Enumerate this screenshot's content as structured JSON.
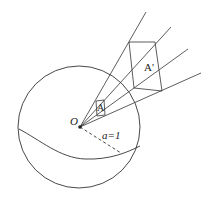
{
  "diagram": {
    "type": "geometry",
    "labels": {
      "origin": "O",
      "small_patch": "A",
      "projected_patch": "A'",
      "radius": "a=1"
    },
    "colors": {
      "stroke": "#333333",
      "background": "#ffffff"
    }
  }
}
